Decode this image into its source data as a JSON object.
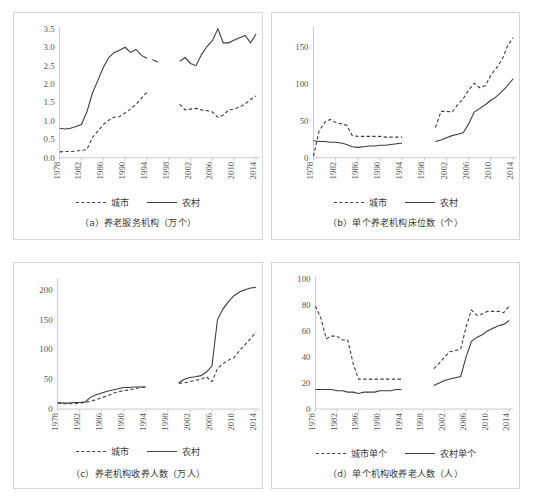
{
  "figure": {
    "background": "#ffffff",
    "series_color": "#3c3c3c",
    "axis_color": "#c9c9c9"
  },
  "legend_common": {
    "urban_label": "城市",
    "rural_label": "农村",
    "urban_style": "dashed",
    "rural_style": "solid"
  },
  "legend_d": {
    "urban_label": "城市单个",
    "rural_label": "农村单个"
  },
  "captions": {
    "a": "（a）养老服务机构（万个）",
    "b": "（b）单个养老机构床位数（个）",
    "c": "（c）养老机构收养人数（万人）",
    "d": "（d）单个机构收养老人数（人）"
  },
  "x_tick_labels": [
    "1978",
    "1982",
    "1986",
    "1990",
    "1994",
    "1998",
    "2002",
    "2006",
    "2010",
    "2014"
  ],
  "chart_data": [
    {
      "id": "a",
      "type": "line",
      "title": "（a）养老服务机构（万个）",
      "xlabel": "",
      "ylabel": "",
      "xlim": [
        1978,
        2014
      ],
      "ylim": [
        0.0,
        3.5
      ],
      "ytick_labels": [
        "0.0",
        "0.5",
        "1.0",
        "1.5",
        "2.0",
        "2.5",
        "3.0",
        "3.5"
      ],
      "ytick_values": [
        0.0,
        0.5,
        1.0,
        1.5,
        2.0,
        2.5,
        3.0,
        3.5
      ],
      "xtick_labels": [
        "1978",
        "1982",
        "1986",
        "1990",
        "1994",
        "1998",
        "2002",
        "2006",
        "2010",
        "2014"
      ],
      "xtick_values": [
        1978,
        1982,
        1986,
        1990,
        1994,
        1998,
        2002,
        2006,
        2010,
        2014
      ],
      "grid": false,
      "legend_position": "below-axes",
      "note": "series break between 1994 and 2000 (missing data)",
      "series": [
        {
          "name": "农村",
          "style": "solid",
          "segments": [
            {
              "x": [
                1978,
                1979,
                1980,
                1981,
                1982,
                1983,
                1984,
                1985,
                1986,
                1987,
                1988,
                1989,
                1990,
                1991,
                1992,
                1993,
                1994
              ],
              "y": [
                0.8,
                0.78,
                0.8,
                0.85,
                0.9,
                1.25,
                1.75,
                2.1,
                2.45,
                2.72,
                2.86,
                2.92,
                3.0,
                2.86,
                2.94,
                2.78,
                2.7
              ]
            },
            {
              "x": [
                1995,
                1996
              ],
              "y": [
                2.66,
                2.6
              ]
            },
            {
              "x": [
                2000,
                2001,
                2002,
                2003,
                2004,
                2005,
                2006,
                2007,
                2008,
                2009,
                2010,
                2011,
                2012,
                2013,
                2014
              ],
              "y": [
                2.62,
                2.72,
                2.56,
                2.5,
                2.8,
                3.02,
                3.18,
                3.5,
                3.12,
                3.12,
                3.2,
                3.26,
                3.32,
                3.12,
                3.36
              ]
            }
          ]
        },
        {
          "name": "城市",
          "style": "dashed",
          "segments": [
            {
              "x": [
                1978,
                1979,
                1980,
                1981,
                1982,
                1983,
                1984,
                1985,
                1986,
                1987,
                1988,
                1989,
                1990,
                1991,
                1992,
                1993,
                1994
              ],
              "y": [
                0.16,
                0.17,
                0.17,
                0.18,
                0.2,
                0.22,
                0.55,
                0.72,
                0.9,
                1.02,
                1.1,
                1.12,
                1.22,
                1.32,
                1.45,
                1.62,
                1.78
              ]
            },
            {
              "x": [
                1995
              ],
              "y": [
                1.82
              ]
            },
            {
              "x": [
                2000,
                2001,
                2002,
                2003,
                2004,
                2005,
                2006,
                2007,
                2008,
                2009,
                2010,
                2011,
                2012,
                2013,
                2014
              ],
              "y": [
                1.45,
                1.3,
                1.32,
                1.34,
                1.3,
                1.28,
                1.24,
                1.1,
                1.16,
                1.3,
                1.32,
                1.38,
                1.46,
                1.58,
                1.68
              ]
            }
          ]
        }
      ]
    },
    {
      "id": "b",
      "type": "line",
      "title": "（b）单个养老机构床位数（个）",
      "xlabel": "",
      "ylabel": "",
      "xlim": [
        1978,
        2014
      ],
      "ylim": [
        0,
        175
      ],
      "ytick_labels": [
        "0",
        "50",
        "100",
        "150"
      ],
      "ytick_values": [
        0,
        50,
        100,
        150
      ],
      "xtick_labels": [
        "1978",
        "1982",
        "1986",
        "1990",
        "1994",
        "1998",
        "2002",
        "2006",
        "2010",
        "2014"
      ],
      "xtick_values": [
        1978,
        1982,
        1986,
        1990,
        1994,
        1998,
        2002,
        2006,
        2010,
        2014
      ],
      "grid": false,
      "legend_position": "below-axes",
      "note": "series break between 1994 and 2000 (missing data)",
      "series": [
        {
          "name": "农村",
          "style": "solid",
          "segments": [
            {
              "x": [
                1978,
                1979,
                1980,
                1981,
                1982,
                1983,
                1984,
                1985,
                1986,
                1987,
                1988,
                1989,
                1990,
                1991,
                1992,
                1993,
                1994
              ],
              "y": [
                23,
                22,
                22,
                21,
                21,
                20,
                18,
                15,
                14,
                15,
                16,
                16,
                17,
                17,
                18,
                19,
                20
              ]
            },
            {
              "x": [
                2000,
                2001,
                2002,
                2003,
                2004,
                2005,
                2006,
                2007,
                2008,
                2009,
                2010,
                2011,
                2012,
                2013,
                2014
              ],
              "y": [
                22,
                24,
                27,
                30,
                32,
                34,
                46,
                62,
                67,
                72,
                78,
                83,
                90,
                98,
                107
              ]
            }
          ]
        },
        {
          "name": "城市",
          "style": "dashed",
          "segments": [
            {
              "x": [
                1978,
                1979,
                1980,
                1981,
                1982,
                1983,
                1984,
                1985,
                1986,
                1987,
                1988,
                1989,
                1990,
                1991,
                1992,
                1993,
                1994
              ],
              "y": [
                2,
                36,
                48,
                52,
                48,
                46,
                44,
                30,
                29,
                29,
                29,
                29,
                29,
                28,
                28,
                28,
                28
              ]
            },
            {
              "x": [
                2000,
                2001,
                2002,
                2003,
                2004,
                2005,
                2006,
                2007,
                2008,
                2009,
                2010,
                2011,
                2012,
                2013,
                2014
              ],
              "y": [
                41,
                63,
                63,
                62,
                72,
                80,
                92,
                101,
                95,
                98,
                112,
                122,
                133,
                152,
                163
              ]
            }
          ]
        }
      ]
    },
    {
      "id": "c",
      "type": "line",
      "title": "（c）养老机构收养人数（万人）",
      "xlabel": "",
      "ylabel": "",
      "xlim": [
        1978,
        2014
      ],
      "ylim": [
        0,
        215
      ],
      "ytick_labels": [
        "0",
        "50",
        "100",
        "150",
        "200"
      ],
      "ytick_values": [
        0,
        50,
        100,
        150,
        200
      ],
      "xtick_labels": [
        "1978",
        "1982",
        "1986",
        "1990",
        "1994",
        "1998",
        "2002",
        "2006",
        "2010",
        "2014"
      ],
      "xtick_values": [
        1978,
        1982,
        1986,
        1990,
        1994,
        1998,
        2002,
        2006,
        2010,
        2014
      ],
      "grid": false,
      "legend_position": "below-axes",
      "note": "series break between 1994 and 2000 (missing data)",
      "series": [
        {
          "name": "农村",
          "style": "solid",
          "segments": [
            {
              "x": [
                1978,
                1979,
                1980,
                1981,
                1982,
                1983,
                1984,
                1985,
                1986,
                1987,
                1988,
                1989,
                1990,
                1991,
                1992,
                1993,
                1994
              ],
              "y": [
                11,
                10,
                10,
                11,
                11,
                12,
                20,
                24,
                27,
                30,
                32,
                34,
                36,
                36,
                37,
                37,
                37
              ]
            },
            {
              "x": [
                2000,
                2001,
                2002,
                2003,
                2004,
                2005,
                2006,
                2007,
                2008,
                2009,
                2010,
                2011,
                2012,
                2013,
                2014
              ],
              "y": [
                44,
                50,
                53,
                54,
                56,
                62,
                72,
                150,
                168,
                180,
                190,
                196,
                200,
                203,
                204
              ]
            }
          ]
        },
        {
          "name": "城市",
          "style": "dashed",
          "segments": [
            {
              "x": [
                1978,
                1979,
                1980,
                1981,
                1982,
                1983,
                1984,
                1985,
                1986,
                1987,
                1988,
                1989,
                1990,
                1991,
                1992,
                1993,
                1994
              ],
              "y": [
                10,
                9,
                9,
                9,
                10,
                11,
                13,
                16,
                19,
                22,
                26,
                29,
                31,
                32,
                34,
                36,
                37
              ]
            },
            {
              "x": [
                2000,
                2001,
                2002,
                2003,
                2004,
                2005,
                2006,
                2007,
                2008,
                2009,
                2010,
                2011,
                2012,
                2013,
                2014
              ],
              "y": [
                43,
                44,
                46,
                48,
                50,
                54,
                46,
                68,
                76,
                82,
                86,
                98,
                108,
                118,
                129
              ]
            }
          ]
        }
      ]
    },
    {
      "id": "d",
      "type": "line",
      "title": "（d）单个机构收养老人数（人）",
      "xlabel": "",
      "ylabel": "",
      "xlim": [
        1978,
        2014
      ],
      "ylim": [
        0,
        100
      ],
      "ytick_labels": [
        "0",
        "20",
        "40",
        "60",
        "80",
        "100"
      ],
      "ytick_values": [
        0,
        20,
        40,
        60,
        80,
        100
      ],
      "xtick_labels": [
        "1978",
        "1982",
        "1986",
        "1990",
        "1994",
        "1998",
        "2002",
        "2006",
        "2010",
        "2014"
      ],
      "xtick_values": [
        1978,
        1982,
        1986,
        1990,
        1994,
        1998,
        2002,
        2006,
        2010,
        2014
      ],
      "grid": false,
      "legend_position": "below-axes",
      "note": "series break between 1994 and 2000 (missing data)",
      "series": [
        {
          "name": "农村单个",
          "style": "solid",
          "segments": [
            {
              "x": [
                1978,
                1979,
                1980,
                1981,
                1982,
                1983,
                1984,
                1985,
                1986,
                1987,
                1988,
                1989,
                1990,
                1991,
                1992,
                1993,
                1994
              ],
              "y": [
                15,
                15,
                15,
                15,
                14,
                14,
                13,
                13,
                12,
                13,
                13,
                13,
                14,
                14,
                14,
                15,
                15
              ]
            },
            {
              "x": [
                2000,
                2001,
                2002,
                2003,
                2004,
                2005,
                2006,
                2007,
                2008,
                2009,
                2010,
                2011,
                2012,
                2013,
                2014
              ],
              "y": [
                18,
                20,
                22,
                23,
                24,
                25,
                40,
                52,
                55,
                57,
                60,
                62,
                64,
                65,
                68
              ]
            }
          ]
        },
        {
          "name": "城市单个",
          "style": "dashed",
          "segments": [
            {
              "x": [
                1978,
                1979,
                1980,
                1981,
                1982,
                1983,
                1984,
                1985,
                1986,
                1987,
                1988,
                1989,
                1990,
                1991,
                1992,
                1993,
                1994
              ],
              "y": [
                79,
                70,
                54,
                56,
                56,
                53,
                53,
                35,
                23,
                23,
                23,
                23,
                23,
                23,
                23,
                23,
                23
              ]
            },
            {
              "x": [
                2000,
                2001,
                2002,
                2003,
                2004,
                2005,
                2006,
                2007,
                2008,
                2009,
                2010,
                2011,
                2012,
                2013,
                2014
              ],
              "y": [
                31,
                35,
                40,
                44,
                45,
                46,
                63,
                76,
                72,
                73,
                75,
                75,
                75,
                74,
                79
              ]
            }
          ]
        }
      ]
    }
  ]
}
